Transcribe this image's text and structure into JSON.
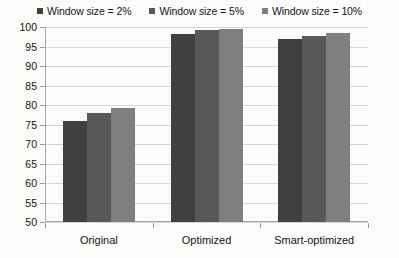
{
  "chart_data": {
    "type": "bar",
    "title": "",
    "subtitle": "",
    "xlabel": "",
    "ylabel": "",
    "categories": [
      "Original",
      "Optimized",
      "Smart-optimized"
    ],
    "series": [
      {
        "name": "Window size = 2%",
        "color": "#404040",
        "values": [
          76.0,
          98.3,
          96.8
        ]
      },
      {
        "name": "Window size = 5%",
        "color": "#595959",
        "values": [
          78.0,
          99.2,
          97.6
        ]
      },
      {
        "name": "Window size = 10%",
        "color": "#808080",
        "values": [
          79.2,
          99.4,
          98.4
        ]
      }
    ],
    "ylim": [
      50,
      100
    ],
    "ytick_values": [
      100,
      95,
      90,
      85,
      80,
      75,
      70,
      65,
      60,
      55,
      50
    ],
    "ytick_labels": [
      "100",
      "95",
      "90",
      "85",
      "80",
      "75",
      "70",
      "65",
      "60",
      "55",
      "50"
    ],
    "grid": true,
    "grid_axis": "y",
    "legend_position": "top-center",
    "bar_orientation": "vertical"
  },
  "legend": {
    "entries": [
      {
        "label": "Window size = 2%",
        "color": "#404040"
      },
      {
        "label": "Window size = 5%",
        "color": "#595959"
      },
      {
        "label": "Window size = 10%",
        "color": "#808080"
      }
    ]
  },
  "axes": {
    "y": {
      "labels": [
        "100",
        "95",
        "90",
        "85",
        "80",
        "75",
        "70",
        "65",
        "60",
        "55",
        "50"
      ],
      "min": 50,
      "max": 100
    },
    "x": {
      "labels": [
        "Original",
        "Optimized",
        "Smart-optimized"
      ]
    }
  }
}
